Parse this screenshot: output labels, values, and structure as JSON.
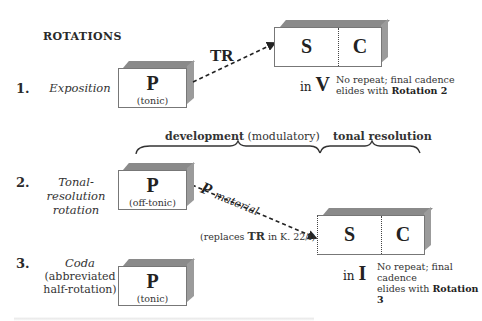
{
  "heading": "ROTATIONS",
  "rows": [
    {
      "number": "1.",
      "label_lines": [
        "Exposition"
      ],
      "box": {
        "letter": "P",
        "sub": "(tonic)"
      }
    },
    {
      "number": "2.",
      "label_lines": [
        "Tonal-resolution",
        "rotation"
      ],
      "box": {
        "letter": "P",
        "sub": "(off-tonic)"
      }
    },
    {
      "number": "3.",
      "label_lines": [
        "Coda"
      ],
      "sub_lines": [
        "(abbreviated",
        "half-rotation)"
      ],
      "box": {
        "letter": "P",
        "sub": "(tonic)"
      }
    }
  ],
  "exposition_target": {
    "arrow_label": "TR",
    "s": "S",
    "c": "C",
    "key_prefix": "in",
    "key": "V",
    "note_line1": "No repeat; final cadence",
    "note_line2_prefix": "elides with",
    "note_line2_bold": "Rotation 2"
  },
  "second_rotation_target": {
    "arrow_label_main": "P",
    "arrow_label_sub": "material",
    "replaces_prefix": "(replaces",
    "replaces_bold": "TR",
    "replaces_suffix": "in K. 22/i)",
    "s": "S",
    "c": "C",
    "key_prefix": "in",
    "key": "I",
    "note_line1": "No repeat; final cadence",
    "note_line2_prefix": "elides with",
    "note_line2_bold": "Rotation 3"
  },
  "braces": [
    {
      "bold": "development",
      "rest": "(modulatory)"
    },
    {
      "bold": "tonal resolution",
      "rest": ""
    }
  ],
  "colors": {
    "box_top": "#8a8a8a",
    "box_side": "#9b9b9b",
    "box_border": "#777777",
    "text": "#222222"
  }
}
